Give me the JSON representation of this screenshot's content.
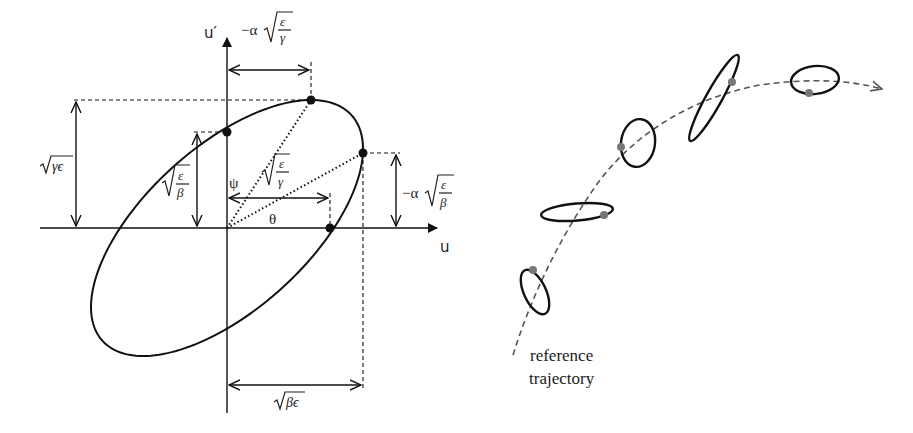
{
  "figure": {
    "left_panel": {
      "title": "Phase-space ellipse",
      "axes": {
        "horizontal": "u",
        "vertical": "u′"
      },
      "angles": {
        "psi": "ψ",
        "theta": "θ"
      },
      "twiss": {
        "alpha": -0.62,
        "note": "tilted ellipse, upper-right / lower-left orientation"
      },
      "dimension_labels": {
        "top_offset": {
          "prefix": "−α",
          "numerator": "ε",
          "denominator": "γ"
        },
        "max_uprime": {
          "radicand": "γϵ"
        },
        "uprime_intercept": {
          "numerator": "ε",
          "denominator": "β"
        },
        "diagonal": {
          "numerator": "ε",
          "denominator": "γ"
        },
        "right_offset": {
          "prefix": "−α",
          "numerator": "ε",
          "denominator": "β"
        },
        "max_u": {
          "radicand": "βϵ"
        }
      }
    },
    "right_panel": {
      "label_line1": "reference",
      "label_line2": "trajectory",
      "ellipse_count": 5
    },
    "colors": {
      "ink": "#111111",
      "dash": "#555555",
      "marker": "#777777"
    }
  }
}
